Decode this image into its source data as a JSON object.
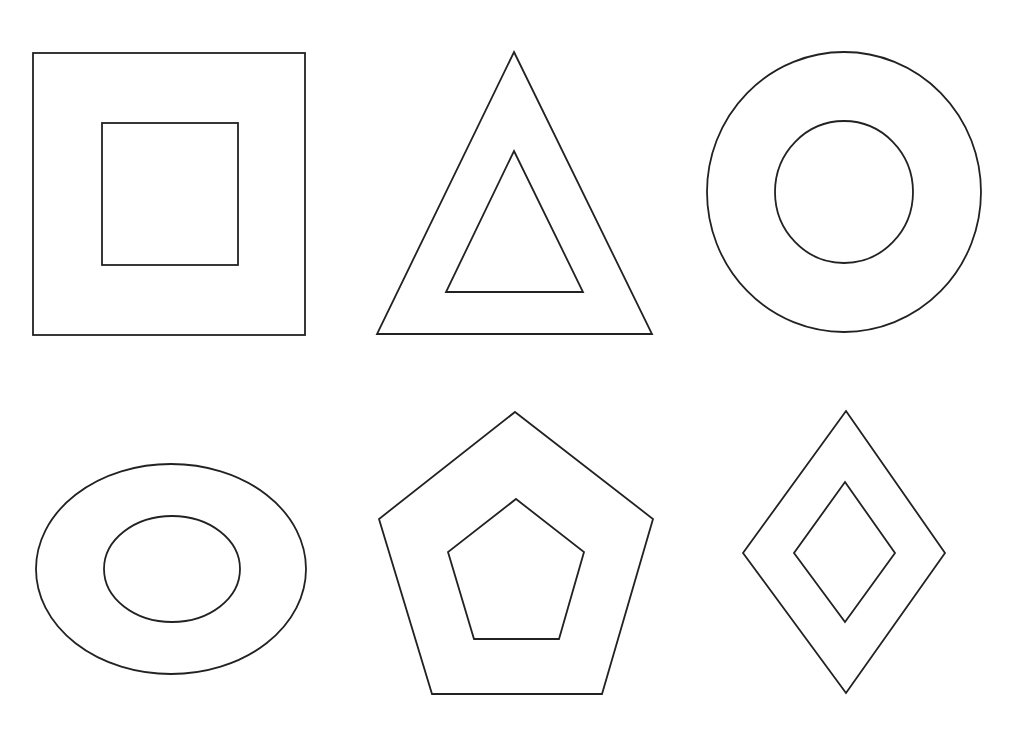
{
  "canvas": {
    "width": 1009,
    "height": 733,
    "background": "#ffffff",
    "stroke_color": "#222222"
  },
  "figures": [
    {
      "name": "nested-squares",
      "type": "rect",
      "outer": {
        "x": 33,
        "y": 53,
        "width": 272,
        "height": 282
      },
      "inner": {
        "x": 102,
        "y": 123,
        "width": 136,
        "height": 142
      }
    },
    {
      "name": "nested-triangles",
      "type": "polygon",
      "outer": "514,52 652,334 377,334",
      "inner": "514,151 583,292 446,292"
    },
    {
      "name": "nested-circles",
      "type": "ellipse",
      "outer": {
        "cx": 844,
        "cy": 192,
        "rx": 137,
        "ry": 140
      },
      "inner": {
        "cx": 844,
        "cy": 192,
        "rx": 69,
        "ry": 71
      }
    },
    {
      "name": "nested-ellipses",
      "type": "ellipse",
      "outer": {
        "cx": 171,
        "cy": 569,
        "rx": 135,
        "ry": 105
      },
      "inner": {
        "cx": 172,
        "cy": 569,
        "rx": 68,
        "ry": 53
      }
    },
    {
      "name": "nested-pentagons",
      "type": "polygon",
      "outer": "515,412 653,519 602,694 432,694 379,519",
      "inner": "516,499 584,552 559,639 474,639 448,552"
    },
    {
      "name": "nested-diamonds",
      "type": "polygon",
      "outer": "846,411 945,553 846,693 743,553",
      "inner": "845,482 895,553 845,622 794,553"
    }
  ]
}
